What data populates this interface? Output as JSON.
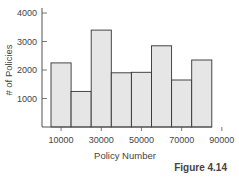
{
  "chart_data": {
    "type": "bar",
    "subtype": "histogram",
    "title": "",
    "xlabel": "Policy Number",
    "ylabel": "# of Policies",
    "bin_edges": [
      0,
      10000,
      20000,
      30000,
      40000,
      50000,
      60000,
      70000,
      80000,
      90000
    ],
    "categories": [
      "0-10000",
      "10000-20000",
      "20000-30000",
      "30000-40000",
      "40000-50000",
      "50000-60000",
      "60000-70000",
      "70000-80000",
      "80000-90000"
    ],
    "values": [
      2250,
      1250,
      3400,
      1900,
      1920,
      2850,
      1650,
      2350,
      0
    ],
    "bars": [
      {
        "x0": 5000,
        "x1": 15000,
        "value": 2250
      },
      {
        "x0": 15000,
        "x1": 25000,
        "value": 1250
      },
      {
        "x0": 25000,
        "x1": 35000,
        "value": 3400
      },
      {
        "x0": 35000,
        "x1": 45000,
        "value": 1900
      },
      {
        "x0": 45000,
        "x1": 55000,
        "value": 1920
      },
      {
        "x0": 55000,
        "x1": 65000,
        "value": 2850
      },
      {
        "x0": 65000,
        "x1": 75000,
        "value": 1650
      },
      {
        "x0": 75000,
        "x1": 85000,
        "value": 2350
      }
    ],
    "x_ticks": [
      10000,
      30000,
      50000,
      70000,
      90000
    ],
    "y_ticks": [
      1000,
      2000,
      3000,
      4000
    ],
    "ylim": [
      0,
      4200
    ],
    "grid": false,
    "legend": null,
    "bar_fill": "#e6e6e6",
    "bar_stroke": "#333333"
  },
  "figure_label": "Figure 4.14"
}
